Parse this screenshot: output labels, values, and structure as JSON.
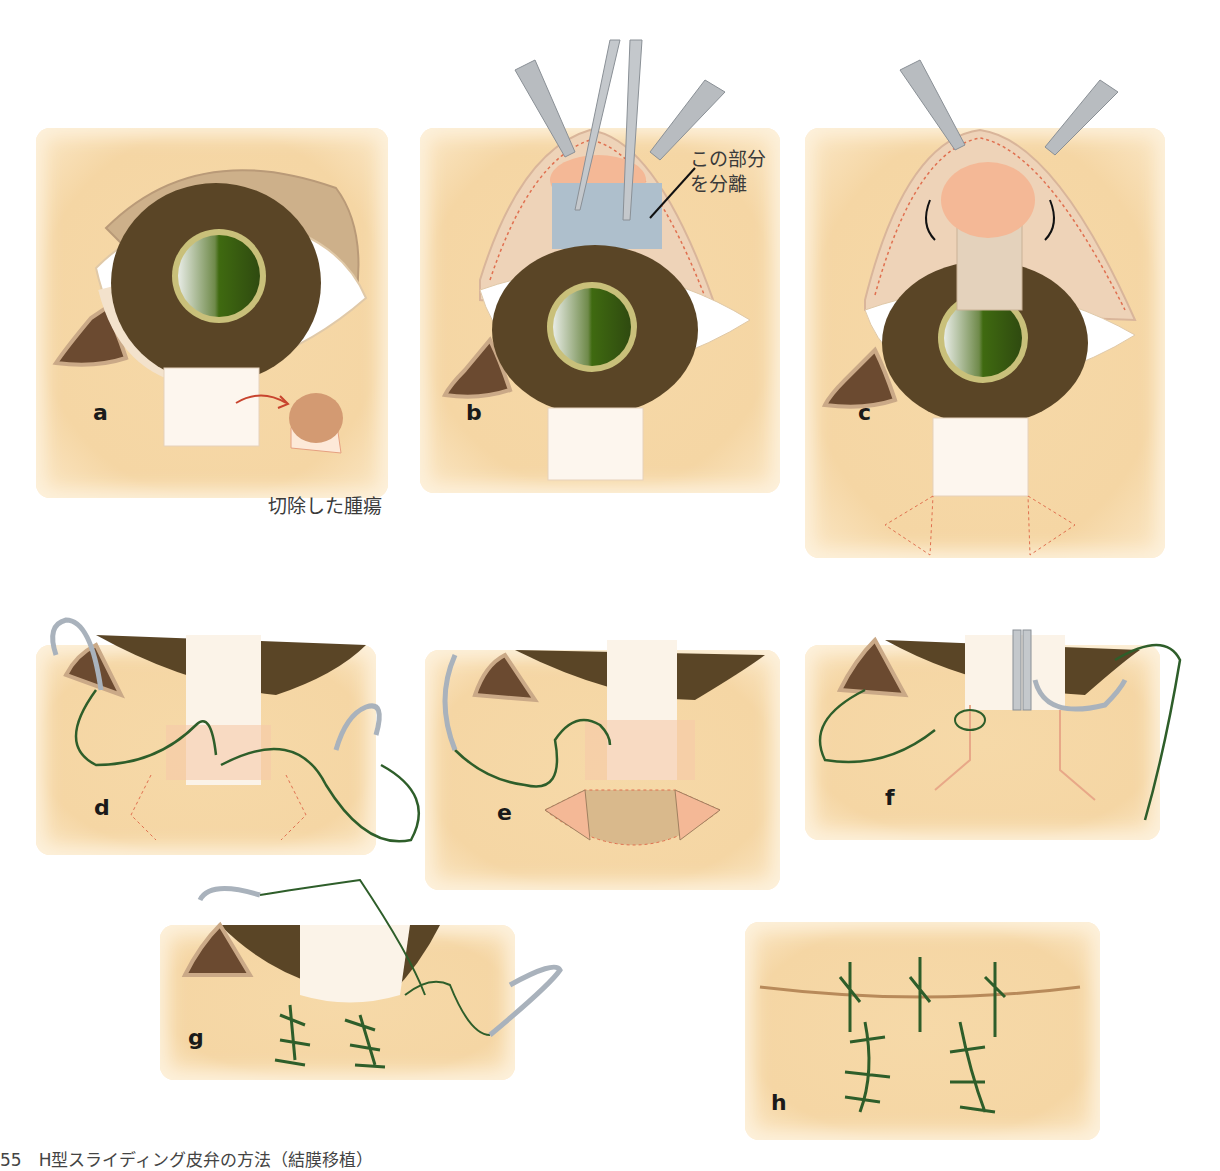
{
  "figure": {
    "caption": "55　H型スライディング皮弁の方法（結膜移植）",
    "colors": {
      "skin": "#f5d6a4",
      "iris_outer": "#5a4526",
      "pupil": "#4d7a1a",
      "iris_ring": "#c9c07a",
      "suture": "#2e5e2a",
      "incision_dotted": "#e07050",
      "flap": "#f4b896",
      "conjunctiva_blue": "#aebfcc",
      "tumor": "#d39a72",
      "instrument": "#b8bcc0"
    },
    "panels": [
      {
        "id": "a",
        "label": "a",
        "annotation": "切除した腫瘍"
      },
      {
        "id": "b",
        "label": "b",
        "annotation_line1": "この部分",
        "annotation_line2": "を分離"
      },
      {
        "id": "c",
        "label": "c"
      },
      {
        "id": "d",
        "label": "d"
      },
      {
        "id": "e",
        "label": "e"
      },
      {
        "id": "f",
        "label": "f"
      },
      {
        "id": "g",
        "label": "g"
      },
      {
        "id": "h",
        "label": "h"
      }
    ]
  }
}
